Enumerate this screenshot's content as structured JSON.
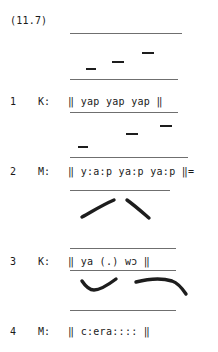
{
  "document": {
    "type": "linguistic-transcript-excerpt",
    "example_label": "(11.7)",
    "turns": [
      {
        "number": "1",
        "speaker": "K:",
        "text": "‖ yap yap yap ‖",
        "top": 96
      },
      {
        "number": "2",
        "speaker": "M:",
        "text": "‖ y:a:p ya:p ya:p ‖=",
        "top": 166
      },
      {
        "number": "3",
        "speaker": "K:",
        "text": "‖ ya (.) wɔ ‖",
        "top": 256
      },
      {
        "number": "4",
        "speaker": "M:",
        "text": "‖ c:era:::: ‖",
        "top": 326
      }
    ],
    "staff_lines": [
      {
        "name": "staff-top-turn1",
        "x": 70,
        "y": 33,
        "width": 112
      },
      {
        "name": "staff-bottom-turn1",
        "x": 70,
        "y": 79,
        "width": 108
      },
      {
        "name": "staff-underline-turn1",
        "x": 70,
        "y": 112,
        "width": 108
      },
      {
        "name": "staff-bottom-turn2",
        "x": 70,
        "y": 157,
        "width": 118
      },
      {
        "name": "staff-top-turn3",
        "x": 70,
        "y": 190,
        "width": 100
      },
      {
        "name": "staff-bottom-turn3",
        "x": 70,
        "y": 248,
        "width": 106
      },
      {
        "name": "staff-underline-turn3",
        "x": 70,
        "y": 270,
        "width": 106
      },
      {
        "name": "staff-top-turn4",
        "x": 70,
        "y": 310,
        "width": 106
      }
    ],
    "tone_dashes": [
      {
        "name": "tone-dash-low-turn1",
        "x": 86,
        "y": 68,
        "width": 10
      },
      {
        "name": "tone-dash-mid-turn1",
        "x": 112,
        "y": 61,
        "width": 12
      },
      {
        "name": "tone-dash-high-turn1",
        "x": 142,
        "y": 52,
        "width": 12
      },
      {
        "name": "tone-dash-low-turn2",
        "x": 78,
        "y": 146,
        "width": 10
      },
      {
        "name": "tone-dash-mid-turn2",
        "x": 126,
        "y": 133,
        "width": 12
      },
      {
        "name": "tone-dash-high-turn2",
        "x": 160,
        "y": 125,
        "width": 12
      }
    ],
    "pitch_strokes": [
      {
        "name": "pitch-stroke-rising-turn2",
        "x": 80,
        "y": 198,
        "width": 42,
        "height": 22,
        "path": "M 2 19 C 10 15 20 8 34 2",
        "stroke_width": 3.4
      },
      {
        "name": "pitch-stroke-falling-turn2",
        "x": 124,
        "y": 198,
        "width": 40,
        "height": 22,
        "path": "M 3 2 C 10 7 18 14 25 20",
        "stroke_width": 3.4
      },
      {
        "name": "pitch-stroke-dip-rise-turn3",
        "x": 80,
        "y": 276,
        "width": 46,
        "height": 20,
        "path": "M 2 5 C 6 11 10 14 14 14 C 20 14 28 9 36 3",
        "stroke_width": 3.4
      },
      {
        "name": "pitch-stroke-level-fall-turn3",
        "x": 134,
        "y": 276,
        "width": 56,
        "height": 22,
        "path": "M 2 6 C 14 3 28 2 38 5 C 44 7 48 12 52 18",
        "stroke_width": 3.4
      }
    ]
  }
}
